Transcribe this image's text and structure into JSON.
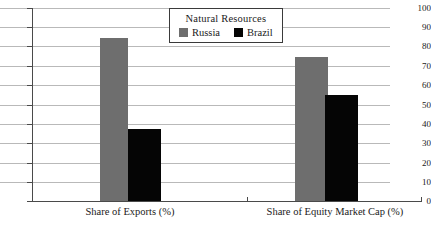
{
  "chart_data": {
    "type": "bar",
    "title": "",
    "subtitle": "",
    "xlabel": "",
    "ylabel": "",
    "categories": [
      "Share of Exports (%)",
      "Share of Equity Market Cap (%)"
    ],
    "series": [
      {
        "name": "Russia",
        "color": "#6e6e6e",
        "values": [
          84.5,
          74.5
        ]
      },
      {
        "name": "Brazil",
        "color": "#050505",
        "values": [
          37.5,
          55.0
        ]
      }
    ],
    "ylim": [
      0,
      100
    ],
    "ytick_labels": [
      "100",
      "90",
      "80",
      "70",
      "60",
      "50",
      "40",
      "30",
      "20",
      "10",
      "0"
    ],
    "ytick_values": [
      100,
      90,
      80,
      70,
      60,
      50,
      40,
      30,
      20,
      10,
      0
    ],
    "grid": true,
    "grid_axis": "y",
    "legend": {
      "title": "Natural Resources",
      "position": "top-center",
      "boxed": true,
      "entries": [
        {
          "label": "Russia",
          "swatch": "russia-swatch",
          "color": "#6e6e6e"
        },
        {
          "label": "Brazil",
          "swatch": "brazil-swatch",
          "color": "#050505"
        }
      ]
    }
  }
}
